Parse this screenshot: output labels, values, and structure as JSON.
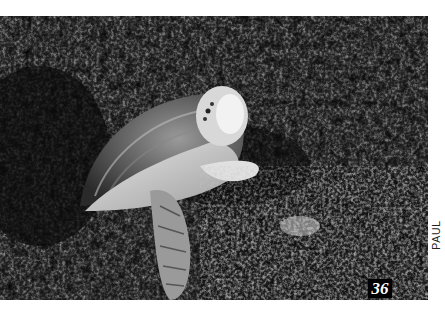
{
  "photo": {
    "subject": "sea turtle resting on coral reef",
    "style": "black-and-white photograph"
  },
  "page_number": "36",
  "credit": "PAUL HUMANN"
}
